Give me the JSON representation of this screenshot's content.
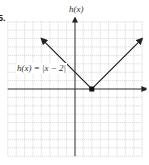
{
  "problem_number": "5.",
  "chart_data": {
    "type": "line",
    "title": "",
    "xlabel": "x",
    "ylabel": "h(x)",
    "function_label": "h(x) = |x − 2|",
    "xlim": [
      -8,
      8
    ],
    "ylim": [
      -8,
      8
    ],
    "grid": true,
    "series": [
      {
        "name": "h(x) = |x − 2|",
        "x": [
          -4,
          2,
          8
        ],
        "y": [
          6,
          0,
          6
        ],
        "arrows_at_ends": true
      }
    ],
    "annotations": [
      {
        "type": "point",
        "x": 2,
        "y": 0,
        "label": "vertex"
      }
    ]
  },
  "colors": {
    "grid": "#b8b8b8",
    "axes": "#333333",
    "curve": "#222222"
  }
}
